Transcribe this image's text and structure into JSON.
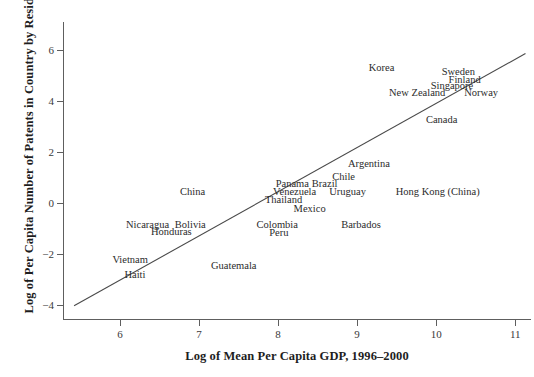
{
  "chart_data": {
    "type": "scatter",
    "title": "",
    "xlabel": "Log of Mean Per Capita GDP, 1996–2000",
    "ylabel": "Log of Per Capita Number of Patents in Country by Residents",
    "xlim": [
      5.28,
      11.2
    ],
    "ylim": [
      -4.6,
      7.1
    ],
    "xticks": [
      6,
      7,
      8,
      9,
      10,
      11
    ],
    "yticks": [
      6,
      4,
      2,
      0,
      -2,
      -4
    ],
    "xtick_labels": [
      "6",
      "7",
      "8",
      "9",
      "10",
      "11"
    ],
    "ytick_labels": [
      "6",
      "4",
      "2",
      "0",
      "−2",
      "−4"
    ],
    "grid": false,
    "legend": false,
    "legend_position": "none",
    "marker_style": "text-label-only",
    "trend_line": {
      "label": "fitted regression line",
      "x_start": 5.42,
      "y_start": -4.04,
      "x_end": 11.13,
      "y_end": 5.86,
      "slope": 1.734,
      "color": "#4a4a4a"
    },
    "points": [
      {
        "label": "Korea",
        "x": 9.31,
        "y": 5.3
      },
      {
        "label": "Sweden",
        "x": 10.28,
        "y": 5.14
      },
      {
        "label": "Finland",
        "x": 10.36,
        "y": 4.83
      },
      {
        "label": "Singapore",
        "x": 10.2,
        "y": 4.59
      },
      {
        "label": "Norway",
        "x": 10.57,
        "y": 4.32
      },
      {
        "label": "New Zealand",
        "x": 9.76,
        "y": 4.31
      },
      {
        "label": "Canada",
        "x": 10.07,
        "y": 3.26
      },
      {
        "label": "Argentina",
        "x": 9.15,
        "y": 1.51
      },
      {
        "label": "Chile",
        "x": 8.83,
        "y": 1.01
      },
      {
        "label": "Panama",
        "x": 8.18,
        "y": 0.72
      },
      {
        "label": "Brazil",
        "x": 8.59,
        "y": 0.72
      },
      {
        "label": "Venezuela",
        "x": 8.21,
        "y": 0.43
      },
      {
        "label": "Uruguay",
        "x": 8.88,
        "y": 0.43
      },
      {
        "label": "China",
        "x": 6.92,
        "y": 0.43
      },
      {
        "label": "Hong Kong (China)",
        "x": 10.02,
        "y": 0.43
      },
      {
        "label": "Thailand",
        "x": 8.07,
        "y": 0.1
      },
      {
        "label": "Mexico",
        "x": 8.4,
        "y": -0.24
      },
      {
        "label": "Nicaragua",
        "x": 6.35,
        "y": -0.86
      },
      {
        "label": "Bolivia",
        "x": 6.89,
        "y": -0.86
      },
      {
        "label": "Colombia",
        "x": 7.99,
        "y": -0.86
      },
      {
        "label": "Barbados",
        "x": 9.05,
        "y": -0.86
      },
      {
        "label": "Honduras",
        "x": 6.65,
        "y": -1.14
      },
      {
        "label": "Peru",
        "x": 8.01,
        "y": -1.17
      },
      {
        "label": "Vietnam",
        "x": 6.13,
        "y": -2.24
      },
      {
        "label": "Guatemala",
        "x": 7.44,
        "y": -2.49
      },
      {
        "label": "Haiti",
        "x": 6.19,
        "y": -2.82
      }
    ]
  }
}
